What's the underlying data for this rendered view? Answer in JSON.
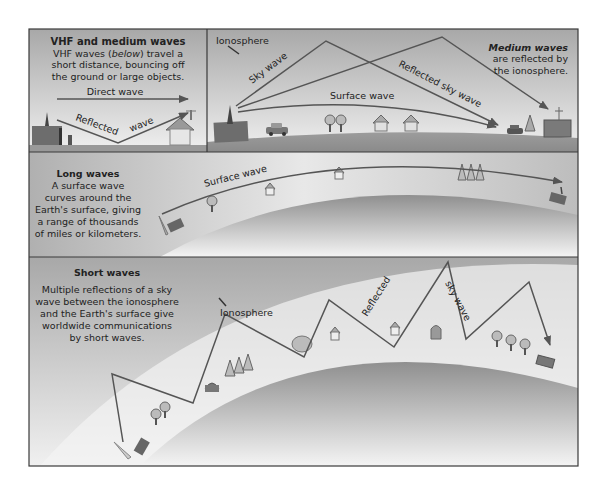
{
  "panels": {
    "vhf": {
      "title": "VHF and medium waves",
      "desc_line1_pre": "VHF waves (",
      "desc_line1_em": "below",
      "desc_line1_post": ") travel a",
      "desc_line2": "short distance, bouncing off",
      "desc_line3": "the ground or large objects.",
      "direct_wave": "Direct wave",
      "reflected": "Reflected",
      "wave": "wave"
    },
    "medium": {
      "ionosphere": "Ionosphere",
      "sky_wave": "Sky wave",
      "reflected_sky_wave": "Reflected sky wave",
      "surface_wave": "Surface wave",
      "title": "Medium waves",
      "desc_line1": "are reflected by",
      "desc_line2": "the ionosphere."
    },
    "long": {
      "title": "Long waves",
      "desc": [
        "A surface wave",
        "curves around the",
        "Earth's surface, giving",
        "a range of thousands",
        "of miles or kilometers."
      ],
      "surface_wave": "Surface wave"
    },
    "short": {
      "title": "Short waves",
      "desc": [
        "Multiple reflections of a sky",
        "wave between the ionosphere",
        "and the Earth's surface give",
        "worldwide communications",
        "by short waves."
      ],
      "ionosphere": "Ionosphere",
      "reflected": "Reflected",
      "sky_wave": "sky wave"
    }
  },
  "colors": {
    "border": "#3a3a3a",
    "wave_line": "#555555",
    "ground": "#9a9a9a",
    "sky_top": "#a9a9a9",
    "sky_bottom": "#f2f2f2",
    "building": "#6d6d6d"
  }
}
